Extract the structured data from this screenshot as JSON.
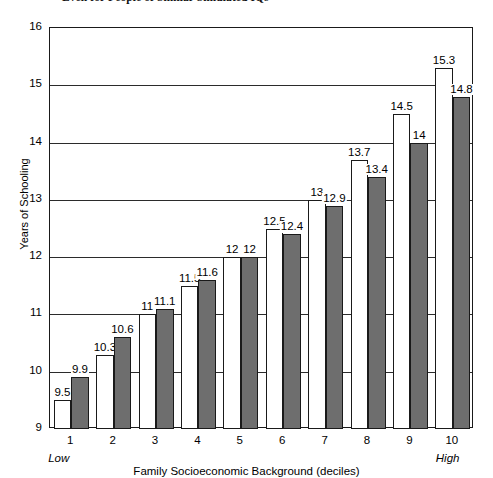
{
  "chart_data": {
    "type": "bar",
    "title": "Even for People of Similar Simulated IQs",
    "xlabel": "Family Socioeconomic Background (deciles)",
    "ylabel": "Years of Schooling",
    "categories": [
      "1",
      "2",
      "3",
      "4",
      "5",
      "6",
      "7",
      "8",
      "9",
      "10"
    ],
    "axis_end_labels": {
      "low": "Low",
      "high": "High"
    },
    "ylim": [
      9,
      16
    ],
    "yticks": [
      "9",
      "10",
      "11",
      "12",
      "13",
      "14",
      "15",
      "16"
    ],
    "grid": true,
    "legend": "none",
    "series": [
      {
        "name": "light",
        "style": "white-bar",
        "color": "#ffffff",
        "values": [
          9.5,
          10.3,
          11,
          11.5,
          12,
          12.5,
          13,
          13.7,
          14.5,
          15.3
        ],
        "labels": [
          "9.5",
          "10.3",
          "11",
          "11.5",
          "12",
          "12.5",
          "13",
          "13.7",
          "14.5",
          "15.3"
        ]
      },
      {
        "name": "dark",
        "style": "gray-bar",
        "color": "#6e6e6e",
        "values": [
          9.9,
          10.6,
          11.1,
          11.6,
          12,
          12.4,
          12.9,
          13.4,
          14,
          14.8
        ],
        "labels": [
          "9.9",
          "10.6",
          "11.1",
          "11.6",
          "12",
          "12.4",
          "12.9",
          "13.4",
          "14",
          "14.8"
        ]
      }
    ]
  }
}
